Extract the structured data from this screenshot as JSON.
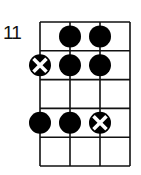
{
  "diagram": {
    "type": "scale-fretboard",
    "start_fret_label": "11",
    "strings": 4,
    "frets": 5,
    "colors": {
      "line": "#111111",
      "dot": "#000000",
      "mark": "#ffffff",
      "background": "#ffffff"
    },
    "positions": [
      {
        "fret_row": 1,
        "string": 2,
        "type": "dot"
      },
      {
        "fret_row": 1,
        "string": 3,
        "type": "dot"
      },
      {
        "fret_row": 2,
        "string": 1,
        "type": "root-x"
      },
      {
        "fret_row": 2,
        "string": 2,
        "type": "dot"
      },
      {
        "fret_row": 2,
        "string": 3,
        "type": "dot"
      },
      {
        "fret_row": 4,
        "string": 1,
        "type": "dot"
      },
      {
        "fret_row": 4,
        "string": 2,
        "type": "dot"
      },
      {
        "fret_row": 4,
        "string": 3,
        "type": "root-x"
      }
    ]
  }
}
